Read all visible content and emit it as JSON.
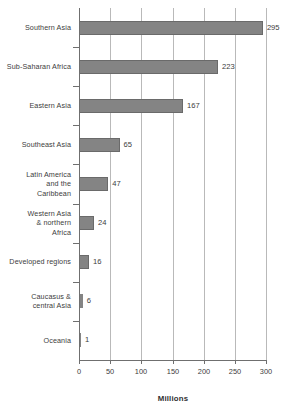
{
  "chart_data": {
    "type": "bar",
    "orientation": "horizontal",
    "title": "",
    "xlabel": "Millions",
    "ylabel": "",
    "xlim": [
      0,
      300
    ],
    "xticks": [
      0,
      50,
      100,
      150,
      200,
      250,
      300
    ],
    "grid": true,
    "legend": false,
    "categories": [
      "Southern Asia",
      "Sub-Saharan Africa",
      "Eastern Asia",
      "Southeast Asia",
      "Latin America and the Caribbean",
      "Western Asia & northern Africa",
      "Developed regions",
      "Caucasus & central Asia",
      "Oceania"
    ],
    "category_lines": [
      [
        "Southern Asia"
      ],
      [
        "Sub-Saharan Africa"
      ],
      [
        "Eastern Asia"
      ],
      [
        "Southeast Asia"
      ],
      [
        "Latin America",
        "and the",
        "Caribbean"
      ],
      [
        "Western Asia",
        "& northern",
        "Africa"
      ],
      [
        "Developed regions"
      ],
      [
        "Caucasus &",
        "central Asia"
      ],
      [
        "Oceania"
      ]
    ],
    "values": [
      295,
      223,
      167,
      65,
      47,
      24,
      16,
      6,
      1
    ],
    "value_labels": [
      "295",
      "223",
      "167",
      "65",
      "47",
      "24",
      "16",
      "6",
      "1"
    ],
    "bar_color": "#848484",
    "bar_edge_color": "#6a6a6a",
    "grid_color": "#b9b9b9",
    "axis_color": "#6f6f6f",
    "background_color": "#ffffff",
    "text_color": "#3c3c3c"
  }
}
